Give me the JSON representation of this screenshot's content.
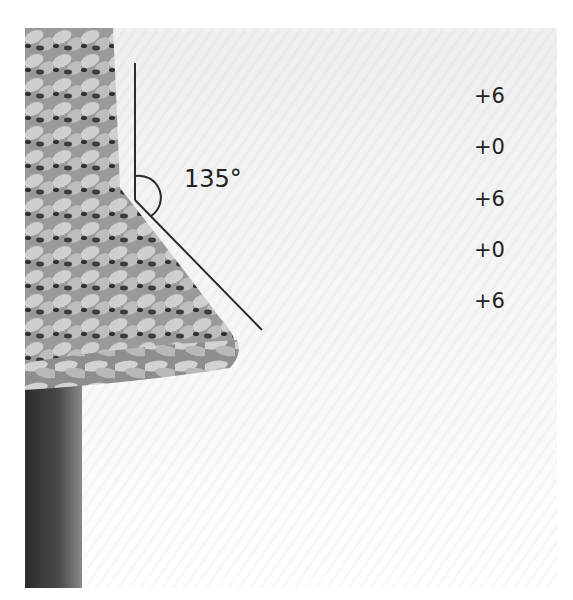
{
  "diagram": {
    "angle_label": "135°",
    "increments": [
      "+6",
      "+0",
      "+6",
      "+0",
      "+6"
    ],
    "colors": {
      "line": "#2a2a2a",
      "text": "#222222",
      "crochet_light": "#bdbdbd",
      "crochet_dark": "#4a4a4a",
      "stick": "#3a3a3a"
    }
  }
}
